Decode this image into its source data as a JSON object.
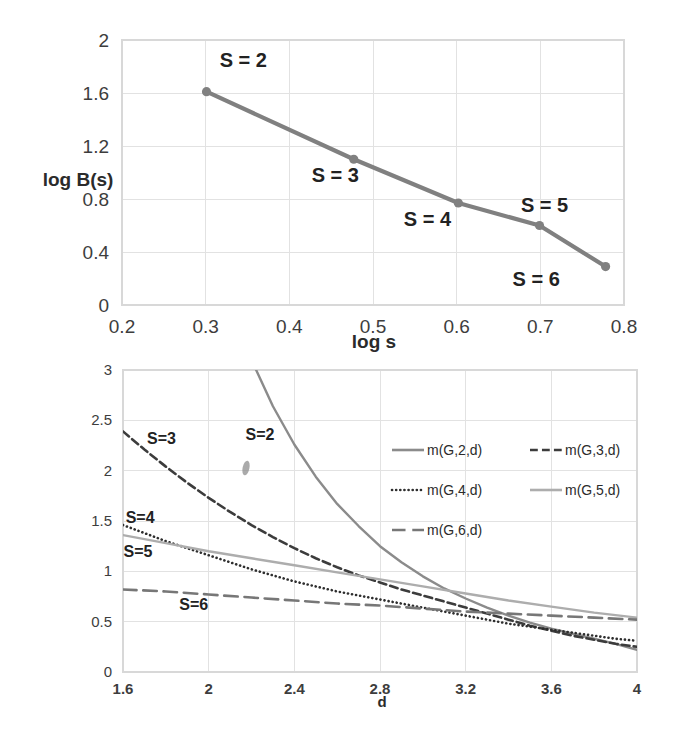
{
  "figure": {
    "background": "#ffffff",
    "line_color_primary": "#808080",
    "line_color_dark": "#3a3a3a",
    "line_color_light": "#a8a8a8",
    "grid_color": "#e2e2e2"
  },
  "chart_data": [
    {
      "id": "top",
      "type": "line",
      "title": "",
      "xlabel": "log s",
      "ylabel": "log B(s)",
      "xlim": [
        0.2,
        0.8
      ],
      "ylim": [
        0,
        2
      ],
      "xticks": [
        "0.2",
        "0.3",
        "0.4",
        "0.5",
        "0.6",
        "0.7",
        "0.8"
      ],
      "xtick_values": [
        0.2,
        0.3,
        0.4,
        0.5,
        0.6,
        0.7,
        0.8
      ],
      "yticks": [
        "0",
        "0.4",
        "0.8",
        "1.2",
        "1.6",
        "2"
      ],
      "ytick_values": [
        0,
        0.4,
        0.8,
        1.2,
        1.6,
        2
      ],
      "grid": true,
      "legend": "none",
      "markers": true,
      "series": [
        {
          "name": "log B(s)",
          "color": "#808080",
          "x": [
            0.301,
            0.477,
            0.602,
            0.699,
            0.778
          ],
          "y": [
            1.61,
            1.1,
            0.77,
            0.6,
            0.29
          ]
        }
      ],
      "annotations": [
        {
          "text": "S = 2",
          "x": 0.345,
          "y": 1.8
        },
        {
          "text": "S = 3",
          "x": 0.455,
          "y": 0.93
        },
        {
          "text": "S = 4",
          "x": 0.565,
          "y": 0.6
        },
        {
          "text": "S = 5",
          "x": 0.705,
          "y": 0.7
        },
        {
          "text": "S = 6",
          "x": 0.695,
          "y": 0.14
        }
      ]
    },
    {
      "id": "bottom",
      "type": "line",
      "title": "",
      "xlabel": "d",
      "ylabel": "",
      "xlim": [
        1.6,
        4
      ],
      "ylim": [
        0,
        3
      ],
      "xticks": [
        "1.6",
        "2",
        "2.4",
        "2.8",
        "3.2",
        "3.6",
        "4"
      ],
      "xtick_values": [
        1.6,
        2,
        2.4,
        2.8,
        3.2,
        3.6,
        4
      ],
      "yticks": [
        "0",
        "0.5",
        "1",
        "1.5",
        "2",
        "2.5",
        "3"
      ],
      "ytick_values": [
        0,
        0.5,
        1,
        1.5,
        2,
        2.5,
        3
      ],
      "grid": true,
      "legend": "inside-upper-right",
      "markers": false,
      "series": [
        {
          "name": "m(G,2,d)",
          "style": "solid",
          "color": "#8b8b8b",
          "width": 2.4,
          "x": [
            1.6,
            1.7,
            1.8,
            1.9,
            2.0,
            2.1,
            2.2,
            2.3,
            2.4,
            2.5,
            2.6,
            2.7,
            2.8,
            2.9,
            3.0,
            3.1,
            3.2,
            3.3,
            3.4,
            3.5,
            3.6,
            3.7,
            3.8,
            3.9,
            4.0
          ],
          "y": [
            8.6,
            7.2,
            6.05,
            5.1,
            4.3,
            3.66,
            3.1,
            2.64,
            2.26,
            1.94,
            1.67,
            1.45,
            1.25,
            1.09,
            0.95,
            0.83,
            0.73,
            0.64,
            0.56,
            0.49,
            0.43,
            0.38,
            0.33,
            0.28,
            0.22
          ]
        },
        {
          "name": "m(G,3,d)",
          "style": "dashed",
          "color": "#3c3c3c",
          "width": 2.6,
          "x": [
            1.6,
            1.7,
            1.8,
            1.9,
            2.0,
            2.1,
            2.2,
            2.3,
            2.4,
            2.5,
            2.6,
            2.7,
            2.8,
            2.9,
            3.0,
            3.1,
            3.2,
            3.3,
            3.4,
            3.5,
            3.6,
            3.7,
            3.8,
            3.9,
            4.0
          ],
          "y": [
            2.39,
            2.21,
            2.04,
            1.88,
            1.73,
            1.59,
            1.46,
            1.34,
            1.23,
            1.13,
            1.04,
            0.96,
            0.89,
            0.82,
            0.76,
            0.7,
            0.64,
            0.58,
            0.52,
            0.46,
            0.41,
            0.36,
            0.32,
            0.28,
            0.25
          ]
        },
        {
          "name": "m(G,4,d)",
          "style": "dotted",
          "color": "#2e2e2e",
          "width": 2.6,
          "x": [
            1.6,
            1.7,
            1.8,
            1.9,
            2.0,
            2.1,
            2.2,
            2.3,
            2.4,
            2.5,
            2.6,
            2.7,
            2.8,
            2.9,
            3.0,
            3.1,
            3.2,
            3.3,
            3.4,
            3.5,
            3.6,
            3.7,
            3.8,
            3.9,
            4.0
          ],
          "y": [
            1.46,
            1.38,
            1.3,
            1.23,
            1.16,
            1.09,
            1.02,
            0.96,
            0.9,
            0.85,
            0.8,
            0.76,
            0.72,
            0.68,
            0.64,
            0.6,
            0.56,
            0.52,
            0.48,
            0.45,
            0.42,
            0.39,
            0.36,
            0.33,
            0.31
          ]
        },
        {
          "name": "m(G,5,d)",
          "style": "solid",
          "color": "#adadad",
          "width": 2.4,
          "x": [
            1.6,
            1.8,
            2.0,
            2.2,
            2.4,
            2.6,
            2.8,
            3.0,
            3.2,
            3.4,
            3.6,
            3.8,
            4.0
          ],
          "y": [
            1.36,
            1.28,
            1.2,
            1.13,
            1.06,
            0.99,
            0.92,
            0.85,
            0.78,
            0.71,
            0.65,
            0.59,
            0.54
          ]
        },
        {
          "name": "m(G,6,d)",
          "style": "longdash",
          "color": "#777777",
          "width": 2.6,
          "x": [
            1.6,
            1.8,
            2.0,
            2.2,
            2.4,
            2.6,
            2.8,
            3.0,
            3.2,
            3.4,
            3.6,
            3.8,
            4.0
          ],
          "y": [
            0.82,
            0.8,
            0.77,
            0.74,
            0.71,
            0.68,
            0.66,
            0.63,
            0.6,
            0.58,
            0.56,
            0.54,
            0.52
          ]
        }
      ],
      "annotations": [
        {
          "text": "S=2",
          "x": 2.24,
          "y": 2.3
        },
        {
          "text": "S=3",
          "x": 1.78,
          "y": 2.26
        },
        {
          "text": "S=4",
          "x": 1.68,
          "y": 1.48
        },
        {
          "text": "S=5",
          "x": 1.67,
          "y": 1.14
        },
        {
          "text": "S=6",
          "x": 1.93,
          "y": 0.62
        }
      ],
      "legend_items": [
        {
          "label": "m(G,2,d)",
          "style": "solid",
          "color": "#8b8b8b"
        },
        {
          "label": "m(G,3,d)",
          "style": "dashed",
          "color": "#3c3c3c"
        },
        {
          "label": "m(G,4,d)",
          "style": "dotted",
          "color": "#2e2e2e"
        },
        {
          "label": "m(G,5,d)",
          "style": "solid",
          "color": "#adadad"
        },
        {
          "label": "m(G,6,d)",
          "style": "longdash",
          "color": "#777777"
        }
      ]
    }
  ]
}
